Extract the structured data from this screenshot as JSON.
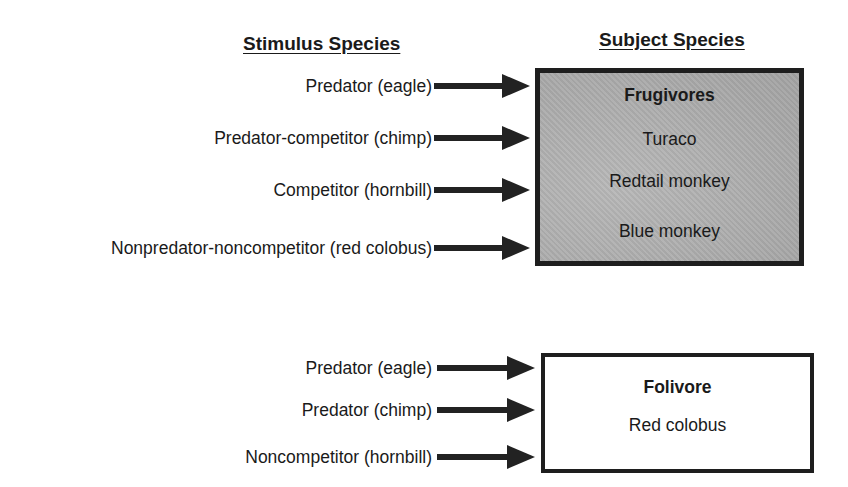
{
  "headers": {
    "stimulus": "Stimulus Species",
    "subject": "Subject Species"
  },
  "groups": [
    {
      "stimuli": [
        "Predator (eagle)",
        "Predator-competitor (chimp)",
        "Competitor (hornbill)",
        "Nonpredator-noncompetitor (red colobus)"
      ],
      "subject_box": {
        "title": "Frugivores",
        "members": [
          "Turaco",
          "Redtail monkey",
          "Blue monkey"
        ],
        "fill": "#ababab"
      }
    },
    {
      "stimuli": [
        "Predator (eagle)",
        "Predator (chimp)",
        "Noncompetitor (hornbill)"
      ],
      "subject_box": {
        "title": "Folivore",
        "members": [
          "Red colobus"
        ],
        "fill": "#ffffff"
      }
    }
  ]
}
